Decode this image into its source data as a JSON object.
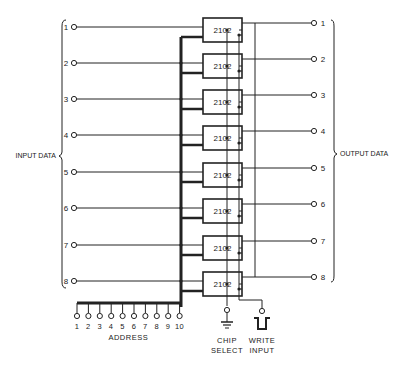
{
  "diagram": {
    "chip_label": "2102",
    "chip_count": 8,
    "input_group_label": "INPUT DATA",
    "output_group_label": "OUTPUT DATA",
    "input_pins": [
      "1",
      "2",
      "3",
      "4",
      "5",
      "6",
      "7",
      "8"
    ],
    "output_pins": [
      "1",
      "2",
      "3",
      "4",
      "5",
      "6",
      "7",
      "8"
    ],
    "address_pins": [
      "1",
      "2",
      "3",
      "4",
      "5",
      "6",
      "7",
      "8",
      "9",
      "10"
    ],
    "address_label": "ADDRESS",
    "chip_select_label_line1": "CHIP",
    "chip_select_label_line2": "SELECT",
    "write_input_label_line1": "WRITE",
    "write_input_label_line2": "INPUT",
    "colors": {
      "ink": "#222222",
      "background": "#ffffff"
    }
  }
}
